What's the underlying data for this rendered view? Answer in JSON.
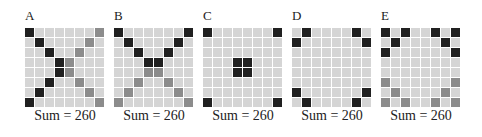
{
  "colors": {
    "black": "#202020",
    "mid": "#8c8c8c",
    "light": "#d5d5d5"
  },
  "panels": [
    {
      "label": "A",
      "sum_label": "Sum = 260",
      "x": 25,
      "grid": [
        "k......m",
        ".k....m.",
        "..k..m..",
        "...km...",
        "...km...",
        "..k..m..",
        ".k....m.",
        "k......m"
      ]
    },
    {
      "label": "B",
      "sum_label": "Sum = 260",
      "x": 114,
      "grid": [
        "k......k",
        ".k....k.",
        "..k..k..",
        "...kk...",
        "...mm...",
        "..m..m..",
        ".m....m.",
        "m......m"
      ]
    },
    {
      "label": "C",
      "sum_label": "Sum = 260",
      "x": 203,
      "grid": [
        "k......k",
        "........",
        "........",
        "...kk...",
        "...kk...",
        "........",
        "........",
        "k......k"
      ]
    },
    {
      "label": "D",
      "sum_label": "Sum = 260",
      "x": 292,
      "grid": [
        ".k....k.",
        "k......k",
        "........",
        "........",
        "........",
        "........",
        "k......k",
        ".k....k."
      ]
    },
    {
      "label": "E",
      "sum_label": "Sum = 260",
      "x": 381,
      "grid": [
        "k.k..k.k",
        ".k....k.",
        "k......k",
        "........",
        "........",
        "m......m",
        ".m....m.",
        "m.m..m.m"
      ]
    }
  ]
}
